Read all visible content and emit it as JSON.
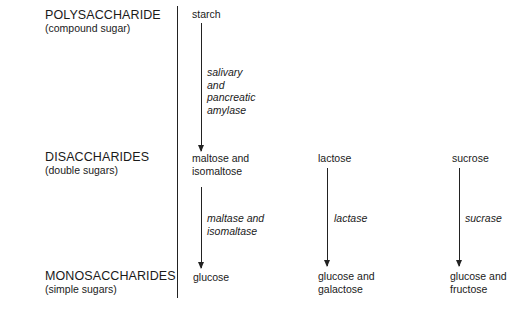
{
  "levels": [
    {
      "title": "POLYSACCHARIDE",
      "subtitle": "(compound sugar)"
    },
    {
      "title": "DISACCHARIDES",
      "subtitle": "(double sugars)"
    },
    {
      "title": "MONOSACCHARIDES",
      "subtitle": "(simple sugars)"
    }
  ],
  "pathways": {
    "starch": {
      "source": "starch",
      "enzyme_lines": [
        "salivary",
        "and",
        "pancreatic",
        "amylase"
      ],
      "product_lines": [
        "maltose and",
        "isomaltose"
      ]
    },
    "maltose": {
      "enzyme_lines": [
        "maltase and",
        "isomaltase"
      ],
      "product_lines": [
        "glucose"
      ]
    },
    "lactose": {
      "source": "lactose",
      "enzyme_lines": [
        "lactase"
      ],
      "product_lines": [
        "glucose and",
        "galactose"
      ]
    },
    "sucrose": {
      "source": "sucrose",
      "enzyme_lines": [
        "sucrase"
      ],
      "product_lines": [
        "glucose and",
        "fructose"
      ]
    }
  }
}
